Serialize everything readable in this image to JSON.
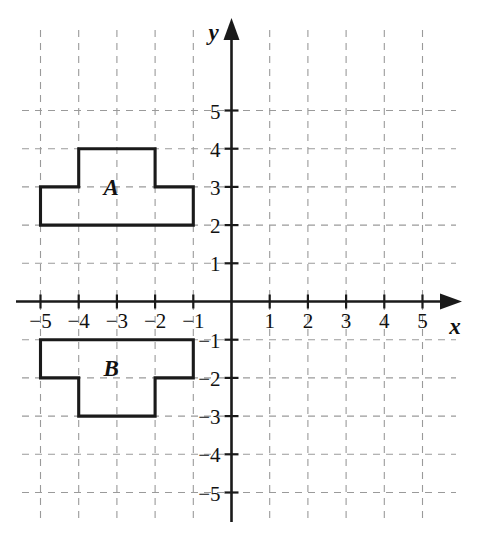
{
  "chart_data": {
    "type": "scatter",
    "title": "",
    "xlabel": "x",
    "ylabel": "y",
    "xlim": [
      -5.8,
      5.8
    ],
    "ylim": [
      -5.8,
      5.8
    ],
    "grid": true,
    "legend": "none",
    "x_ticks": [
      -5,
      -4,
      -3,
      -2,
      -1,
      1,
      2,
      3,
      4,
      5
    ],
    "y_ticks": [
      -5,
      -4,
      -3,
      -2,
      -1,
      1,
      2,
      3,
      4,
      5
    ],
    "x_tick_labels": [
      "−5",
      "−4",
      "−3",
      "−2",
      "−1",
      "1",
      "2",
      "3",
      "4",
      "5"
    ],
    "y_tick_labels": [
      "−5",
      "−4",
      "−3",
      "−2",
      "−1",
      "1",
      "2",
      "3",
      "4",
      "5"
    ],
    "shapes": [
      {
        "name": "A",
        "label": "A",
        "label_x": -3.15,
        "label_y": 3.0,
        "closed": true,
        "points": [
          [
            -5,
            2
          ],
          [
            -5,
            3
          ],
          [
            -4,
            3
          ],
          [
            -4,
            4
          ],
          [
            -2,
            4
          ],
          [
            -2,
            3
          ],
          [
            -1,
            3
          ],
          [
            -1,
            2
          ]
        ]
      },
      {
        "name": "B",
        "label": "B",
        "label_x": -3.15,
        "label_y": -1.75,
        "closed": true,
        "points": [
          [
            -5,
            -2
          ],
          [
            -5,
            -1
          ],
          [
            -1,
            -1
          ],
          [
            -1,
            -2
          ],
          [
            -2,
            -2
          ],
          [
            -2,
            -3
          ],
          [
            -4,
            -3
          ],
          [
            -4,
            -2
          ]
        ]
      }
    ],
    "annotations": [
      "A",
      "B"
    ]
  },
  "axes": {
    "x_axis_label": "x",
    "y_axis_label": "y"
  },
  "colors": {
    "grid": "#9a9a9a",
    "axis": "#1a1a1a",
    "shape_stroke": "#1a1a1a",
    "background": "#ffffff"
  }
}
